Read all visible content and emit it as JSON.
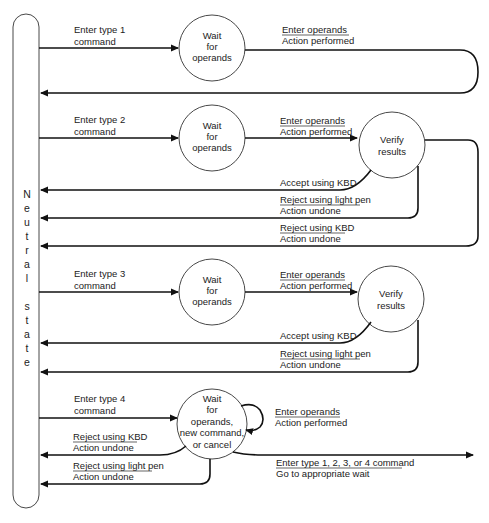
{
  "neutral_state": {
    "letters": [
      "N",
      "e",
      "u",
      "t",
      "r",
      "a",
      "l",
      "",
      "s",
      "t",
      "a",
      "t",
      "e"
    ]
  },
  "row1": {
    "enter_cmd": [
      "Enter type 1",
      "command"
    ],
    "wait_state": [
      "Wait",
      "for",
      "operands"
    ],
    "transition": {
      "top": "Enter operands",
      "bottom": "Action performed"
    }
  },
  "row2": {
    "enter_cmd": [
      "Enter type 2",
      "command"
    ],
    "wait_state": [
      "Wait",
      "for",
      "operands"
    ],
    "transition": {
      "top": "Enter operands",
      "bottom": "Action performed"
    },
    "verify_state": [
      "Verify",
      "results"
    ],
    "accept": "Accept using KBD",
    "reject_pen": {
      "top": "Reject using light pen",
      "bottom": "Action undone"
    },
    "reject_kbd": {
      "top": "Reject using KBD",
      "bottom": "Action undone"
    }
  },
  "row3": {
    "enter_cmd": [
      "Enter type 3",
      "command"
    ],
    "wait_state": [
      "Wait",
      "for",
      "operands"
    ],
    "transition": {
      "top": "Enter operands",
      "bottom": "Action performed"
    },
    "verify_state": [
      "Verify",
      "results"
    ],
    "accept": "Accept using KBD",
    "reject_pen": {
      "top": "Reject using light pen",
      "bottom": "Action undone"
    }
  },
  "row4": {
    "enter_cmd": [
      "Enter type 4",
      "command"
    ],
    "wait_state": [
      "Wait",
      "for",
      "operands,",
      "new command,",
      "or cancel"
    ],
    "self_loop": {
      "top": "Enter operands",
      "bottom": "Action performed"
    },
    "reject_kbd": {
      "top": "Reject using KBD",
      "bottom": "Action undone"
    },
    "reject_pen": {
      "top": "Reject using light pen",
      "bottom": "Action undone"
    },
    "go_wait": {
      "top": "Enter type 1, 2, 3, or 4 command",
      "bottom": "Go to appropriate wait"
    }
  }
}
